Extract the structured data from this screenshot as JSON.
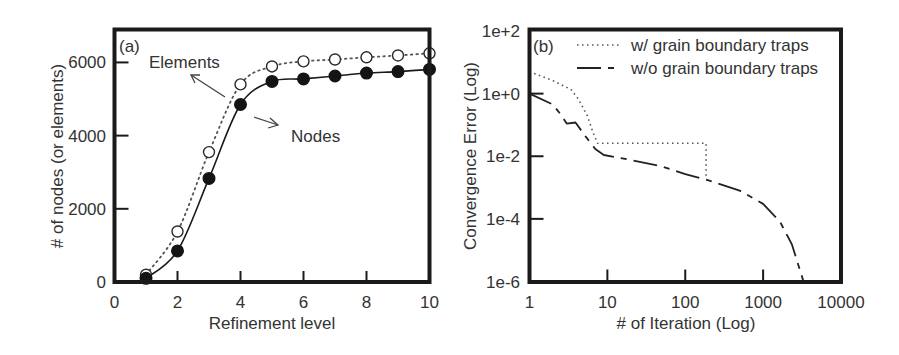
{
  "chart_data": [
    {
      "id": "a",
      "type": "line",
      "panel_label": "(a)",
      "title": "",
      "xlabel": "Refinement level",
      "ylabel": "# of nodes (or elements)",
      "xlim": [
        0,
        10
      ],
      "ylim": [
        0,
        6900
      ],
      "xticks": [
        0,
        2,
        4,
        6,
        8,
        10
      ],
      "xtick_labels": [
        "0",
        "2",
        "4",
        "6",
        "8",
        "10"
      ],
      "yticks": [
        0,
        2000,
        4000,
        6000
      ],
      "ytick_labels": [
        "0",
        "2000",
        "4000",
        "6000"
      ],
      "grid": false,
      "x": [
        1,
        2,
        3,
        4,
        5,
        6,
        7,
        8,
        9,
        10
      ],
      "series": [
        {
          "name": "Elements",
          "style": "dotted",
          "marker": "open-circle",
          "values": [
            200,
            1380,
            3550,
            5400,
            5890,
            6030,
            6080,
            6140,
            6190,
            6250
          ]
        },
        {
          "name": "Nodes",
          "style": "solid",
          "marker": "filled-circle",
          "values": [
            100,
            850,
            2830,
            4850,
            5480,
            5550,
            5630,
            5710,
            5750,
            5810
          ]
        }
      ],
      "annotations": [
        {
          "text": "Elements",
          "points_to": "Elements"
        },
        {
          "text": "Nodes",
          "points_to": "Nodes"
        }
      ]
    },
    {
      "id": "b",
      "type": "line",
      "panel_label": "(b)",
      "title": "",
      "xlabel": "# of Iteration (Log)",
      "ylabel": "Convergence Error (Log)",
      "xscale": "log",
      "yscale": "log",
      "xlim": [
        1,
        10000
      ],
      "ylim": [
        1e-06,
        100
      ],
      "xticks": [
        1,
        10,
        100,
        1000,
        10000
      ],
      "xtick_labels": [
        "1",
        "10",
        "100",
        "1000",
        "10000"
      ],
      "yticks": [
        100,
        1,
        0.01,
        0.0001,
        1e-06
      ],
      "ytick_labels": [
        "1e+2",
        "1e+0",
        "1e-2",
        "1e-4",
        "1e-6"
      ],
      "grid": false,
      "legend_position": "upper right",
      "series": [
        {
          "name": "w/ grain boundary traps",
          "style": "dotted",
          "x": [
            1,
            2,
            3.4,
            4.2,
            5.5,
            6.5,
            7.5,
            185,
            185
          ],
          "y": [
            5.0,
            2.6,
            1.35,
            0.7,
            0.2,
            0.06,
            0.026,
            0.026,
            0.0019
          ]
        },
        {
          "name": "w/o grain boundary traps",
          "style": "long-dash",
          "x": [
            1,
            2,
            2.5,
            3,
            3.9,
            5.2,
            7,
            9,
            20,
            48,
            100,
            185,
            500,
            1000,
            1650,
            2350,
            3300
          ],
          "y": [
            1.0,
            0.45,
            0.22,
            0.11,
            0.12,
            0.044,
            0.017,
            0.011,
            0.0076,
            0.0049,
            0.0027,
            0.0018,
            0.0008,
            0.0003,
            8e-05,
            1.5e-05,
            1e-06
          ]
        }
      ]
    }
  ]
}
